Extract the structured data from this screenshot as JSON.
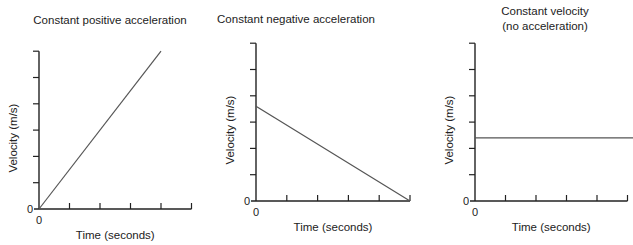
{
  "figure": {
    "line_color": "#555555",
    "axis_color": "#222222",
    "text_color": "#222222"
  },
  "chart_data": [
    {
      "type": "line",
      "title": "Constant positive acceleration",
      "title_lines": [
        "Constant positive acceleration"
      ],
      "xlabel": "Time (seconds)",
      "ylabel": "Velocity (m/s)",
      "x_origin_label": "0",
      "y_origin_label": "0",
      "x_ticks": 5,
      "y_ticks": 6,
      "xlim": [
        0,
        5
      ],
      "ylim": [
        0,
        6
      ],
      "grid": false,
      "legend": null,
      "series": [
        {
          "name": "velocity",
          "x": [
            0,
            4
          ],
          "y": [
            0,
            6
          ]
        }
      ],
      "layout": {
        "ox": 39,
        "oy": 209,
        "x_step": 30.5,
        "y_step": 26.3,
        "title_x": 110,
        "title_y": [
          20
        ],
        "line_end_x": null
      }
    },
    {
      "type": "line",
      "title": "Constant negative acceleration",
      "title_lines": [
        "Constant negative acceleration"
      ],
      "xlabel": "Time (seconds)",
      "ylabel": "Velocity (m/s)",
      "x_origin_label": "0",
      "y_origin_label": "0",
      "x_ticks": 5,
      "y_ticks": 6,
      "xlim": [
        0,
        5
      ],
      "ylim": [
        0,
        6
      ],
      "grid": false,
      "legend": null,
      "series": [
        {
          "name": "velocity",
          "x": [
            0,
            5
          ],
          "y": [
            3.6,
            0
          ]
        }
      ],
      "layout": {
        "ox": 256,
        "oy": 201,
        "x_step": 30.8,
        "y_step": 26.3,
        "title_x": 296,
        "title_y": [
          19
        ],
        "line_end_x": null
      }
    },
    {
      "type": "line",
      "title": "Constant velocity (no acceleration)",
      "title_lines": [
        "Constant velocity",
        "(no acceleration)"
      ],
      "xlabel": "Time (seconds)",
      "ylabel": "Velocity (m/s)",
      "x_origin_label": "0",
      "y_origin_label": "0",
      "x_ticks": 5,
      "y_ticks": 6,
      "xlim": [
        0,
        5
      ],
      "ylim": [
        0,
        6
      ],
      "grid": false,
      "legend": null,
      "series": [
        {
          "name": "velocity",
          "x": [
            0,
            5.2
          ],
          "y": [
            2.4,
            2.4
          ]
        }
      ],
      "layout": {
        "ox": 475,
        "oy": 201,
        "x_step": 30.5,
        "y_step": 26.3,
        "title_x": 545,
        "title_y": [
          11,
          26
        ],
        "line_end_x": 633
      }
    }
  ]
}
